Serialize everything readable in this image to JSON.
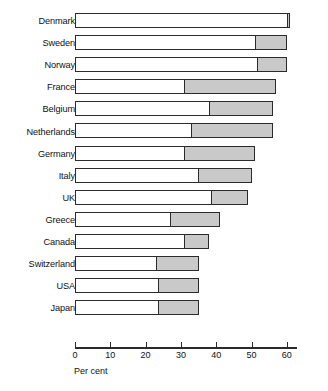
{
  "chart": {
    "type": "bar",
    "orientation": "horizontal",
    "title": "",
    "xlabel": "Per cent",
    "ylabel": "",
    "xlim": [
      0,
      63
    ],
    "ticks": [
      0,
      10,
      20,
      30,
      40,
      50,
      60
    ],
    "tick_labels": [
      "0",
      "10",
      "20",
      "30",
      "40",
      "50",
      "60"
    ],
    "grid": false,
    "legend": null,
    "stacked": true,
    "series": [
      {
        "name": "unshaded-segment",
        "fill": "white"
      },
      {
        "name": "shaded-segment",
        "fill": "stipple-grey"
      }
    ]
  },
  "chart_data": {
    "type": "bar",
    "title": "",
    "xlabel": "Per cent",
    "ylabel": "",
    "xlim": [
      0,
      63
    ],
    "ticks": [
      0,
      10,
      20,
      30,
      40,
      50,
      60
    ],
    "grid": false,
    "categories": [
      "Denmark",
      "Sweden",
      "Norway",
      "France",
      "Belgium",
      "Netherlands",
      "Germany",
      "Italy",
      "UK",
      "Greece",
      "Canada",
      "Switzerland",
      "USA",
      "Japan"
    ],
    "series": [
      {
        "name": "unshaded-segment",
        "values": [
          60.0,
          51.0,
          51.5,
          31.0,
          38.0,
          33.0,
          31.0,
          35.0,
          38.5,
          27.0,
          31.0,
          23.0,
          23.5,
          23.5
        ]
      },
      {
        "name": "shaded-segment",
        "values": [
          1.0,
          9.0,
          8.5,
          26.0,
          18.0,
          23.0,
          20.0,
          15.0,
          10.5,
          14.0,
          7.0,
          12.0,
          11.5,
          11.5
        ]
      }
    ],
    "totals": [
      61.0,
      60.0,
      60.0,
      57.0,
      56.0,
      56.0,
      51.0,
      50.0,
      49.0,
      41.0,
      38.0,
      35.0,
      35.0,
      35.0
    ]
  },
  "colors": {
    "outline": "#2b2b2b",
    "unshaded": "#ffffff",
    "shaded": "#c9c9c9",
    "text": "#111111",
    "background": "#ffffff"
  },
  "rows": [
    {
      "label": "Denmark",
      "split": 60.0,
      "total": 61.0
    },
    {
      "label": "Sweden",
      "split": 51.0,
      "total": 60.0
    },
    {
      "label": "Norway",
      "split": 51.5,
      "total": 60.0
    },
    {
      "label": "France",
      "split": 31.0,
      "total": 57.0
    },
    {
      "label": "Belgium",
      "split": 38.0,
      "total": 56.0
    },
    {
      "label": "Netherlands",
      "split": 33.0,
      "total": 56.0
    },
    {
      "label": "Germany",
      "split": 31.0,
      "total": 51.0
    },
    {
      "label": "Italy",
      "split": 35.0,
      "total": 50.0
    },
    {
      "label": "UK",
      "split": 38.5,
      "total": 49.0
    },
    {
      "label": "Greece",
      "split": 27.0,
      "total": 41.0
    },
    {
      "label": "Canada",
      "split": 31.0,
      "total": 38.0
    },
    {
      "label": "Switzerland",
      "split": 23.0,
      "total": 35.0
    },
    {
      "label": "USA",
      "split": 23.5,
      "total": 35.0
    },
    {
      "label": "Japan",
      "split": 23.5,
      "total": 35.0
    }
  ],
  "axis": {
    "title": "Per cent",
    "tick_labels": [
      "0",
      "10",
      "20",
      "30",
      "40",
      "50",
      "60"
    ]
  }
}
